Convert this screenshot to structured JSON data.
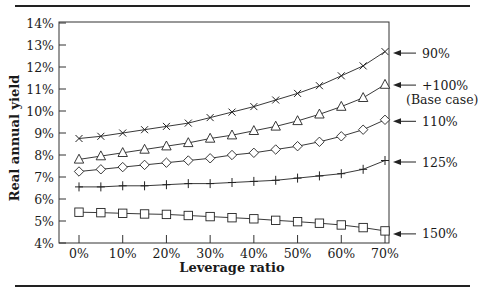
{
  "chart_data": {
    "type": "line",
    "title": "",
    "xlabel": "Leverage ratio",
    "ylabel": "Real annual yield",
    "x": [
      0,
      5,
      10,
      15,
      20,
      25,
      30,
      35,
      40,
      45,
      50,
      55,
      60,
      65,
      70
    ],
    "xticks": [
      "0%",
      "10%",
      "20%",
      "30%",
      "40%",
      "50%",
      "60%",
      "70%"
    ],
    "yticks": [
      "4%",
      "5%",
      "6%",
      "7%",
      "8%",
      "9%",
      "10%",
      "11%",
      "12%",
      "13%",
      "14%"
    ],
    "xlim": [
      0,
      70
    ],
    "ylim": [
      4,
      14
    ],
    "grid": false,
    "legend_position": "right (arrow labels)",
    "series": [
      {
        "name": "90%",
        "marker": "x",
        "values": [
          8.75,
          8.85,
          9.0,
          9.15,
          9.3,
          9.45,
          9.7,
          9.95,
          10.2,
          10.5,
          10.8,
          11.15,
          11.6,
          12.05,
          12.7
        ]
      },
      {
        "name": "+100% (Base case)",
        "marker": "triangle",
        "values": [
          7.8,
          7.95,
          8.1,
          8.25,
          8.4,
          8.55,
          8.75,
          8.9,
          9.1,
          9.3,
          9.55,
          9.85,
          10.2,
          10.6,
          11.2
        ]
      },
      {
        "name": "110%",
        "marker": "diamond",
        "values": [
          7.25,
          7.35,
          7.45,
          7.55,
          7.65,
          7.75,
          7.85,
          8.0,
          8.1,
          8.25,
          8.4,
          8.6,
          8.85,
          9.15,
          9.6
        ]
      },
      {
        "name": "125%",
        "marker": "plus",
        "values": [
          6.55,
          6.55,
          6.6,
          6.6,
          6.65,
          6.7,
          6.7,
          6.75,
          6.8,
          6.85,
          6.95,
          7.05,
          7.15,
          7.35,
          7.75
        ]
      },
      {
        "name": "150%",
        "marker": "square",
        "values": [
          5.4,
          5.38,
          5.35,
          5.32,
          5.3,
          5.25,
          5.2,
          5.15,
          5.1,
          5.03,
          4.97,
          4.9,
          4.82,
          4.7,
          4.55
        ]
      }
    ],
    "annotations": [
      {
        "text": "90%",
        "series": 0
      },
      {
        "text": "+100%",
        "series": 1
      },
      {
        "text": "(Base case)",
        "series": 1
      },
      {
        "text": "110%",
        "series": 2
      },
      {
        "text": "125%",
        "series": 3
      },
      {
        "text": "150%",
        "series": 4
      }
    ]
  }
}
